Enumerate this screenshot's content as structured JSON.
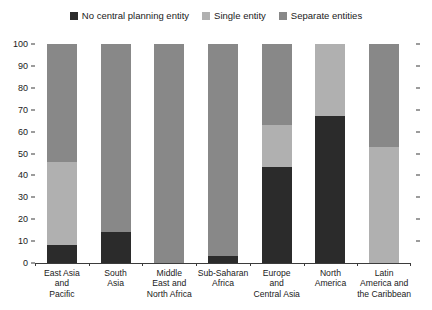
{
  "chart_data": {
    "type": "bar",
    "stacked": true,
    "title": "",
    "subtitle": "",
    "xlabel": "",
    "ylabel": "",
    "ylim": [
      0,
      100
    ],
    "yticks": [
      0,
      10,
      20,
      30,
      40,
      50,
      60,
      70,
      80,
      90,
      100
    ],
    "ytick_labels": [
      "0",
      "10",
      "20",
      "30",
      "40",
      "50",
      "60",
      "70",
      "80",
      "90",
      "100"
    ],
    "grid": false,
    "legend_position": "top-center",
    "categories": [
      "East Asia and Pacific",
      "South Asia",
      "Middle East and North Africa",
      "Sub-Saharan Africa",
      "Europe and Central Asia",
      "North America",
      "Latin America and the Caribbean"
    ],
    "category_lines": [
      [
        "East Asia",
        "and",
        "Pacific"
      ],
      [
        "South",
        "Asia"
      ],
      [
        "Middle",
        "East and",
        "North Africa"
      ],
      [
        "Sub-Saharan",
        "Africa"
      ],
      [
        "Europe",
        "and",
        "Central Asia"
      ],
      [
        "North",
        "America"
      ],
      [
        "Latin",
        "America and",
        "the Caribbean"
      ]
    ],
    "series": [
      {
        "name": "No central planning entity",
        "color": "#2b2b2b",
        "values": [
          8,
          14,
          0,
          3,
          44,
          67,
          0
        ]
      },
      {
        "name": "Single entity",
        "color": "#b0b0b0",
        "values": [
          38,
          0,
          0,
          0,
          19,
          33,
          53
        ]
      },
      {
        "name": "Separate entities",
        "color": "#888888",
        "values": [
          54,
          86,
          100,
          97,
          37,
          0,
          47
        ]
      }
    ]
  },
  "legend": {
    "items": [
      {
        "label": "No central planning entity",
        "color": "#2b2b2b"
      },
      {
        "label": "Single entity",
        "color": "#b0b0b0"
      },
      {
        "label": "Separate entities",
        "color": "#888888"
      }
    ]
  },
  "colors": {
    "axis": "#3b3b3b",
    "text": "#1a1a1a",
    "background": "#ffffff",
    "no_central_planning_entity": "#2b2b2b",
    "single_entity": "#b0b0b0",
    "separate_entities": "#888888"
  }
}
